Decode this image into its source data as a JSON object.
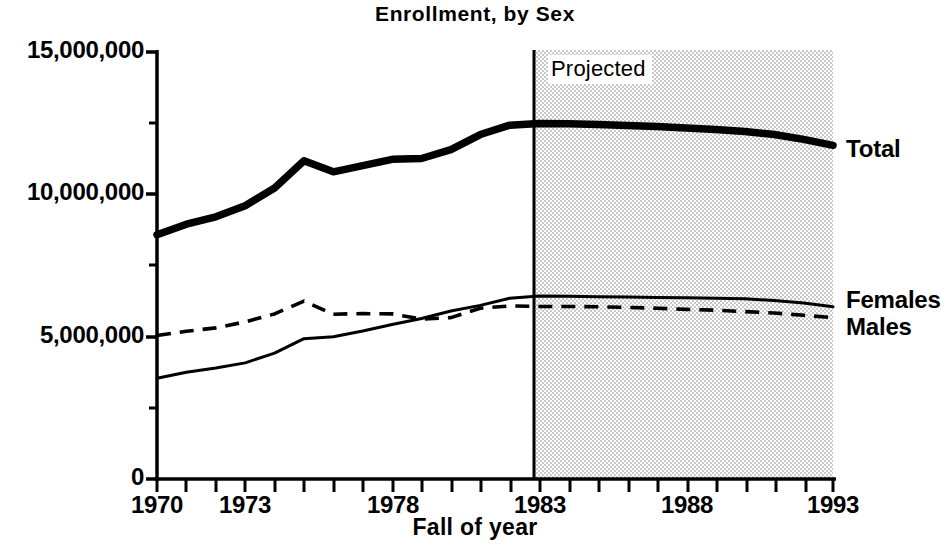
{
  "chart_data": {
    "type": "line",
    "title": "Enrollment, by Sex",
    "xlabel": "Fall of year",
    "ylabel": "",
    "xlim": [
      1970,
      1993
    ],
    "ylim": [
      0,
      15000000
    ],
    "grid": false,
    "legend_position": "right-inline",
    "x_ticks": [
      1970,
      1973,
      1978,
      1983,
      1988,
      1993
    ],
    "x_tick_labels": [
      "1970",
      "1973",
      "1978",
      "1983",
      "1988",
      "1993"
    ],
    "x_minor_tick_interval": 1,
    "y_ticks": [
      0,
      5000000,
      10000000,
      15000000
    ],
    "y_tick_labels": [
      "0",
      "5,000,000",
      "10,000,000",
      "15,000,000"
    ],
    "y_minor_ticks": [
      2500000,
      7500000,
      12500000
    ],
    "annotations": [
      {
        "text": "Projected",
        "x": 1983,
        "region": "1983-1993",
        "shaded": true
      }
    ],
    "x": [
      1970,
      1971,
      1972,
      1973,
      1974,
      1975,
      1976,
      1977,
      1978,
      1979,
      1980,
      1981,
      1982,
      1983,
      1984,
      1985,
      1986,
      1987,
      1988,
      1989,
      1990,
      1991,
      1992,
      1993
    ],
    "series": [
      {
        "name": "Total",
        "style": "solid-thick",
        "values": [
          8580000,
          8950000,
          9210000,
          9600000,
          10220000,
          11180000,
          10790000,
          11010000,
          11230000,
          11260000,
          11570000,
          12100000,
          12430000,
          12490000,
          12480000,
          12450000,
          12420000,
          12380000,
          12330000,
          12280000,
          12210000,
          12100000,
          11930000,
          11720000
        ]
      },
      {
        "name": "Females",
        "style": "solid-thin",
        "values": [
          3540000,
          3750000,
          3900000,
          4080000,
          4420000,
          4930000,
          5000000,
          5200000,
          5430000,
          5640000,
          5900000,
          6100000,
          6350000,
          6430000,
          6420000,
          6400000,
          6390000,
          6380000,
          6370000,
          6350000,
          6330000,
          6270000,
          6180000,
          6050000
        ]
      },
      {
        "name": "Males",
        "style": "dashed",
        "values": [
          5040000,
          5190000,
          5310000,
          5520000,
          5800000,
          6250000,
          5790000,
          5810000,
          5800000,
          5620000,
          5670000,
          6000000,
          6080000,
          6060000,
          6060000,
          6050000,
          6030000,
          6000000,
          5960000,
          5930000,
          5880000,
          5830000,
          5750000,
          5670000
        ]
      }
    ]
  },
  "labels": {
    "series_total": "Total",
    "series_females": "Females",
    "series_males": "Males",
    "projected": "Projected"
  }
}
